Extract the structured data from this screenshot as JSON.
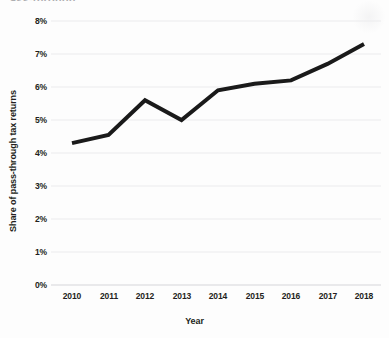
{
  "figure": {
    "cut_off_title_fragment": "ass-through",
    "background_color": "#fdfdfd"
  },
  "chart_data": {
    "type": "line",
    "title": "",
    "xlabel": "Year",
    "ylabel": "Share of pass-through tax returns",
    "x": [
      2010,
      2011,
      2012,
      2013,
      2014,
      2015,
      2016,
      2017,
      2018
    ],
    "categories": [
      "2010",
      "2011",
      "2012",
      "2013",
      "2014",
      "2015",
      "2016",
      "2017",
      "2018"
    ],
    "values": [
      4.3,
      4.55,
      5.6,
      5.0,
      5.9,
      6.1,
      6.2,
      6.7,
      7.3
    ],
    "series": [
      {
        "name": "Share of pass-through tax returns",
        "values": [
          4.3,
          4.55,
          5.6,
          5.0,
          5.9,
          6.1,
          6.2,
          6.7,
          7.3
        ]
      }
    ],
    "ylim": [
      0,
      8
    ],
    "xlim": [
      2010,
      2018
    ],
    "ytick_labels": [
      "0%",
      "1%",
      "2%",
      "3%",
      "4%",
      "5%",
      "6%",
      "7%",
      "8%"
    ],
    "ytick_values": [
      0,
      1,
      2,
      3,
      4,
      5,
      6,
      7,
      8
    ],
    "xtick_labels": [
      "2010",
      "2011",
      "2012",
      "2013",
      "2014",
      "2015",
      "2016",
      "2017",
      "2018"
    ],
    "grid": "horizontal",
    "legend": "none",
    "line_color": "#1a1a1a",
    "line_width": 4,
    "grid_color": "#ececed",
    "annotations": []
  }
}
